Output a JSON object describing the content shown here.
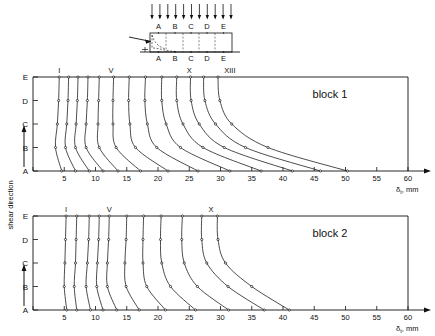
{
  "figure": {
    "schematic": {
      "top_labels": [
        "A",
        "B",
        "C",
        "D",
        "E"
      ],
      "bottom_labels": [
        "A",
        "B",
        "C",
        "D",
        "E"
      ],
      "arrow_count": 11,
      "shear_arrow_name": "shear-load-arrow"
    },
    "y_axis_title": "shear direction",
    "x_axis_label": "δ",
    "x_axis_sub": "t",
    "x_axis_unit": ", mm",
    "axis": {
      "x_ticks": [
        0,
        5,
        10,
        15,
        20,
        25,
        30,
        35,
        40,
        45,
        50,
        55,
        60
      ],
      "x_tick_labels": [
        "",
        "5",
        "10",
        "15",
        "20",
        "25",
        "30",
        "35",
        "40",
        "45",
        "50",
        "55",
        "60"
      ],
      "y_levels": [
        "E",
        "D",
        "C",
        "B",
        "A"
      ],
      "xlim": [
        0,
        60
      ]
    },
    "panels": [
      {
        "name": "block 1",
        "curve_labels": [
          {
            "text": "I",
            "x": 4.2
          },
          {
            "text": "V",
            "x": 12.5
          },
          {
            "text": "X",
            "x": 25.0
          },
          {
            "text": "XIII",
            "x": 31.5
          }
        ],
        "curves": [
          {
            "label": "I",
            "points": [
              [
                4.2,
                "E"
              ],
              [
                4.1,
                "D"
              ],
              [
                3.9,
                "C"
              ],
              [
                3.6,
                "B"
              ],
              [
                4.6,
                "A"
              ]
            ]
          },
          {
            "label": "II",
            "points": [
              [
                5.7,
                "E"
              ],
              [
                5.6,
                "D"
              ],
              [
                5.4,
                "C"
              ],
              [
                5.2,
                "B"
              ],
              [
                6.8,
                "A"
              ]
            ]
          },
          {
            "label": "III",
            "points": [
              [
                7.2,
                "E"
              ],
              [
                7.1,
                "D"
              ],
              [
                6.9,
                "C"
              ],
              [
                6.8,
                "B"
              ],
              [
                9.0,
                "A"
              ]
            ]
          },
          {
            "label": "IV",
            "points": [
              [
                8.8,
                "E"
              ],
              [
                8.7,
                "D"
              ],
              [
                8.5,
                "C"
              ],
              [
                8.5,
                "B"
              ],
              [
                11.2,
                "A"
              ]
            ]
          },
          {
            "label": "V",
            "points": [
              [
                10.6,
                "E"
              ],
              [
                10.5,
                "D"
              ],
              [
                10.4,
                "C"
              ],
              [
                10.6,
                "B"
              ],
              [
                13.6,
                "A"
              ]
            ]
          },
          {
            "label": "VI",
            "points": [
              [
                12.9,
                "E"
              ],
              [
                12.8,
                "D"
              ],
              [
                12.8,
                "C"
              ],
              [
                13.3,
                "B"
              ],
              [
                17.2,
                "A"
              ]
            ]
          },
          {
            "label": "VII",
            "points": [
              [
                15.4,
                "E"
              ],
              [
                15.3,
                "D"
              ],
              [
                15.5,
                "C"
              ],
              [
                16.4,
                "B"
              ],
              [
                21.6,
                "A"
              ]
            ]
          },
          {
            "label": "VIII",
            "points": [
              [
                18.0,
                "E"
              ],
              [
                17.9,
                "D"
              ],
              [
                18.3,
                "C"
              ],
              [
                19.8,
                "B"
              ],
              [
                26.4,
                "A"
              ]
            ]
          },
          {
            "label": "IX",
            "points": [
              [
                20.6,
                "E"
              ],
              [
                20.6,
                "D"
              ],
              [
                21.3,
                "C"
              ],
              [
                23.6,
                "B"
              ],
              [
                31.5,
                "A"
              ]
            ]
          },
          {
            "label": "X",
            "points": [
              [
                23.0,
                "E"
              ],
              [
                23.0,
                "D"
              ],
              [
                24.0,
                "C"
              ],
              [
                27.2,
                "B"
              ],
              [
                36.5,
                "A"
              ]
            ]
          },
          {
            "label": "XI",
            "points": [
              [
                25.2,
                "E"
              ],
              [
                25.3,
                "D"
              ],
              [
                26.6,
                "C"
              ],
              [
                30.6,
                "B"
              ],
              [
                41.5,
                "A"
              ]
            ]
          },
          {
            "label": "XII",
            "points": [
              [
                27.3,
                "E"
              ],
              [
                27.5,
                "D"
              ],
              [
                29.2,
                "C"
              ],
              [
                34.0,
                "B"
              ],
              [
                46.0,
                "A"
              ]
            ]
          },
          {
            "label": "XIII",
            "points": [
              [
                29.6,
                "E"
              ],
              [
                29.9,
                "D"
              ],
              [
                31.8,
                "C"
              ],
              [
                37.6,
                "B"
              ],
              [
                50.3,
                "A"
              ]
            ]
          }
        ]
      },
      {
        "name": "block 2",
        "curve_labels": [
          {
            "text": "I",
            "x": 5.3
          },
          {
            "text": "V",
            "x": 12.2
          },
          {
            "text": "X",
            "x": 28.5
          }
        ],
        "curves": [
          {
            "label": "I",
            "points": [
              [
                5.3,
                "E"
              ],
              [
                5.2,
                "D"
              ],
              [
                5.1,
                "C"
              ],
              [
                5.0,
                "B"
              ],
              [
                5.4,
                "A"
              ]
            ]
          },
          {
            "label": "II",
            "points": [
              [
                7.0,
                "E"
              ],
              [
                6.9,
                "D"
              ],
              [
                6.8,
                "C"
              ],
              [
                6.6,
                "B"
              ],
              [
                7.0,
                "A"
              ]
            ]
          },
          {
            "label": "III",
            "points": [
              [
                9.0,
                "E"
              ],
              [
                8.9,
                "D"
              ],
              [
                8.7,
                "C"
              ],
              [
                8.5,
                "B"
              ],
              [
                9.2,
                "A"
              ]
            ]
          },
          {
            "label": "IV",
            "points": [
              [
                10.6,
                "E"
              ],
              [
                10.5,
                "D"
              ],
              [
                10.3,
                "C"
              ],
              [
                10.2,
                "B"
              ],
              [
                11.2,
                "A"
              ]
            ]
          },
          {
            "label": "V",
            "points": [
              [
                12.2,
                "E"
              ],
              [
                12.1,
                "D"
              ],
              [
                11.9,
                "C"
              ],
              [
                11.9,
                "B"
              ],
              [
                13.4,
                "A"
              ]
            ]
          },
          {
            "label": "VI",
            "points": [
              [
                15.0,
                "E"
              ],
              [
                14.9,
                "D"
              ],
              [
                14.7,
                "C"
              ],
              [
                14.9,
                "B"
              ],
              [
                17.0,
                "A"
              ]
            ]
          },
          {
            "label": "VII",
            "points": [
              [
                17.7,
                "E"
              ],
              [
                17.6,
                "D"
              ],
              [
                17.6,
                "C"
              ],
              [
                18.2,
                "B"
              ],
              [
                21.2,
                "A"
              ]
            ]
          },
          {
            "label": "VIII",
            "points": [
              [
                20.5,
                "E"
              ],
              [
                20.4,
                "D"
              ],
              [
                20.6,
                "C"
              ],
              [
                22.0,
                "B"
              ],
              [
                26.0,
                "A"
              ]
            ]
          },
          {
            "label": "IX",
            "points": [
              [
                23.9,
                "E"
              ],
              [
                23.8,
                "D"
              ],
              [
                24.2,
                "C"
              ],
              [
                26.3,
                "B"
              ],
              [
                31.3,
                "A"
              ]
            ]
          },
          {
            "label": "X",
            "points": [
              [
                27.0,
                "E"
              ],
              [
                27.0,
                "D"
              ],
              [
                27.8,
                "C"
              ],
              [
                31.2,
                "B"
              ],
              [
                37.0,
                "A"
              ]
            ]
          },
          {
            "label": "XI",
            "points": [
              [
                29.5,
                "E"
              ],
              [
                29.6,
                "D"
              ],
              [
                30.8,
                "C"
              ],
              [
                35.0,
                "B"
              ],
              [
                41.0,
                "A"
              ]
            ]
          }
        ]
      }
    ]
  }
}
